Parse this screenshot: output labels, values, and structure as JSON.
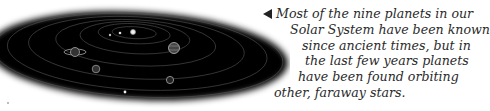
{
  "illustration": {
    "label": "Solar System orbital diagram",
    "bodies": [
      "sun",
      "mercury",
      "venus",
      "earth",
      "mars",
      "jupiter",
      "saturn",
      "uranus",
      "neptune",
      "pluto"
    ]
  },
  "caption": {
    "pointer_icon": "left-triangle-icon",
    "lines": [
      "Most of the nine planets in our",
      "Solar System have been known",
      "since ancient times, but in",
      "the last few years planets",
      "have been found orbiting",
      "other, faraway stars."
    ]
  }
}
